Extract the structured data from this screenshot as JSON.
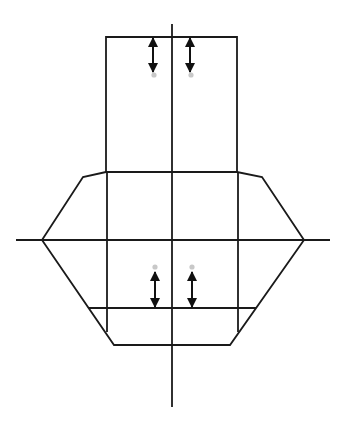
{
  "diagram": {
    "width": 345,
    "height": 426,
    "colors": {
      "background": "#ffffff",
      "line": "#1a1a1a",
      "arrow": "#111111",
      "dot": "#c8c8c8"
    },
    "stroke_width": 1.8,
    "axes": {
      "vertical": {
        "x": 172,
        "y1": 24,
        "y2": 407
      },
      "horizontal": {
        "y": 240,
        "x1": 16,
        "x2": 330
      }
    },
    "upper_rectangle": {
      "x1": 106,
      "x2": 237,
      "y_top": 37,
      "y_bottom": 172
    },
    "octagon_outline": [
      [
        106,
        172
      ],
      [
        83,
        177
      ],
      [
        42,
        240
      ],
      [
        114,
        345
      ],
      [
        230,
        345
      ],
      [
        304,
        240
      ],
      [
        262,
        177
      ],
      [
        237,
        172
      ]
    ],
    "inner_verticals": [
      {
        "x": 107,
        "y1": 172,
        "y2": 332
      },
      {
        "x": 238,
        "y1": 172,
        "y2": 332
      }
    ],
    "lower_horizontal": {
      "y": 308,
      "x1": 88,
      "x2": 256
    },
    "arrows": [
      {
        "name": "upper-left-arrow",
        "x": 153,
        "y1": 38,
        "y2": 72,
        "dot_y": 75,
        "dot_end": "bottom"
      },
      {
        "name": "upper-right-arrow",
        "x": 190,
        "y1": 38,
        "y2": 72,
        "dot_y": 75,
        "dot_end": "bottom"
      },
      {
        "name": "lower-left-arrow",
        "x": 155,
        "y1": 272,
        "y2": 307,
        "dot_y": 267,
        "dot_end": "top"
      },
      {
        "name": "lower-right-arrow",
        "x": 192,
        "y1": 272,
        "y2": 307,
        "dot_y": 267,
        "dot_end": "top"
      }
    ]
  }
}
